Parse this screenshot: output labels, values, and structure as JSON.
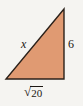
{
  "figure": {
    "type": "right-triangle-diagram",
    "background_color": "#f5f4f1",
    "fill_color": "#e09a72",
    "stroke_color": "#2b211a",
    "text_color": "#1c1713",
    "vertices": {
      "top_right": [
        64,
        9
      ],
      "bottom_right": [
        64,
        79
      ],
      "bottom_left": [
        6,
        79
      ]
    },
    "labels": {
      "hypotenuse": "x",
      "vertical_leg": "6",
      "base_radical_sign": "√",
      "base_radicand": "20",
      "base_full": "√20"
    },
    "geometry": {
      "right_angle_at": "bottom-right",
      "hypotenuse_side": "left",
      "vertical_leg_side": "right",
      "base_side": "bottom"
    }
  }
}
